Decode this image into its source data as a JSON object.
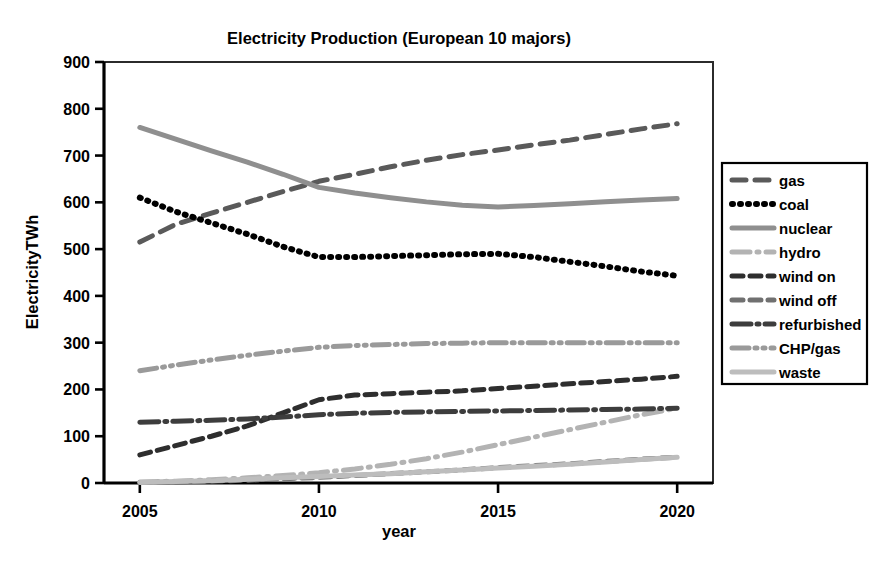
{
  "chart_data": {
    "type": "line",
    "title": "Electricity Production (European 10 majors)",
    "xlabel": "year",
    "ylabel": "ElectricityTWh",
    "xlim": [
      2004,
      2021
    ],
    "ylim": [
      0,
      900
    ],
    "grid": false,
    "legend_position": "right",
    "x_ticks": [
      "2005",
      "2010",
      "2015",
      "2020"
    ],
    "x_tick_values": [
      2005,
      2010,
      2015,
      2020
    ],
    "y_ticks": [
      "0",
      "100",
      "200",
      "300",
      "400",
      "500",
      "600",
      "700",
      "800",
      "900"
    ],
    "y_tick_values": [
      0,
      100,
      200,
      300,
      400,
      500,
      600,
      700,
      800,
      900
    ],
    "x": [
      2005,
      2006,
      2007,
      2008,
      2009,
      2010,
      2011,
      2012,
      2013,
      2014,
      2015,
      2016,
      2017,
      2018,
      2019,
      2020
    ],
    "series": [
      {
        "name": "gas",
        "color": "#5a5a5a",
        "dash": "14,9",
        "width": 5,
        "values": [
          515,
          553,
          577,
          600,
          623,
          645,
          660,
          676,
          690,
          702,
          712,
          723,
          733,
          745,
          757,
          768
        ]
      },
      {
        "name": "coal",
        "color": "#000000",
        "dash": "1,7",
        "width": 6,
        "values": [
          610,
          580,
          556,
          532,
          505,
          483,
          483,
          485,
          487,
          489,
          490,
          483,
          473,
          463,
          452,
          443
        ]
      },
      {
        "name": "nuclear",
        "color": "#8f8f8f",
        "dash": "none",
        "width": 5,
        "values": [
          760,
          735,
          710,
          686,
          660,
          632,
          620,
          610,
          601,
          594,
          590,
          593,
          597,
          601,
          605,
          608
        ]
      },
      {
        "name": "hydro",
        "color": "#b3b3b3",
        "dash": "18,7,2,7",
        "width": 5,
        "values": [
          2,
          4,
          7,
          11,
          16,
          22,
          30,
          40,
          52,
          66,
          82,
          98,
          114,
          130,
          146,
          160
        ]
      },
      {
        "name": "wind on",
        "color": "#2e2e2e",
        "dash": "11,7",
        "width": 5,
        "values": [
          60,
          80,
          100,
          122,
          150,
          178,
          188,
          191,
          194,
          197,
          202,
          207,
          212,
          217,
          222,
          228
        ]
      },
      {
        "name": "wind off",
        "color": "#707070",
        "dash": "11,7",
        "width": 5,
        "values": [
          1,
          2,
          4,
          6,
          9,
          12,
          16,
          20,
          24,
          28,
          33,
          37,
          41,
          46,
          51,
          55
        ]
      },
      {
        "name": "refurbished",
        "color": "#3d3d3d",
        "dash": "19,6,2,6",
        "width": 5,
        "values": [
          130,
          132,
          134,
          137,
          141,
          146,
          149,
          151,
          152,
          153,
          154,
          155,
          156,
          157,
          158,
          160
        ]
      },
      {
        "name": "CHP/gas",
        "color": "#9a9a9a",
        "dash": "17,6,2,6,2,6",
        "width": 5,
        "values": [
          240,
          252,
          263,
          273,
          282,
          290,
          294,
          296,
          298,
          299,
          300,
          300,
          300,
          300,
          300,
          300
        ]
      },
      {
        "name": "waste",
        "color": "#bdbdbd",
        "dash": "none",
        "width": 5,
        "values": [
          1,
          3,
          5,
          8,
          11,
          14,
          17,
          20,
          24,
          28,
          32,
          36,
          40,
          45,
          50,
          55
        ]
      }
    ]
  },
  "legend": {
    "items": [
      {
        "label": "gas"
      },
      {
        "label": "coal"
      },
      {
        "label": "nuclear"
      },
      {
        "label": "hydro"
      },
      {
        "label": "wind on"
      },
      {
        "label": "wind off"
      },
      {
        "label": "refurbished"
      },
      {
        "label": "CHP/gas"
      },
      {
        "label": "waste"
      }
    ]
  }
}
